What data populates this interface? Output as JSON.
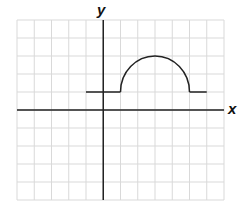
{
  "chart_data": {
    "type": "line",
    "title": "",
    "xlabel": "x",
    "ylabel": "y",
    "xlim": [
      -5,
      7
    ],
    "ylim": [
      -5,
      5
    ],
    "grid": true,
    "tick_labels": false,
    "series": [
      {
        "name": "f(x)",
        "segments": [
          {
            "kind": "line",
            "from": [
              -1,
              1
            ],
            "to": [
              1,
              1
            ]
          },
          {
            "kind": "semicircle",
            "center": [
              3,
              1
            ],
            "radius": 2,
            "from": [
              1,
              1
            ],
            "to": [
              5,
              1
            ],
            "peak": [
              3,
              3
            ]
          },
          {
            "kind": "line",
            "from": [
              5,
              1
            ],
            "to": [
              6,
              1
            ]
          }
        ]
      }
    ]
  },
  "labels": {
    "x": "x",
    "y": "y"
  },
  "colors": {
    "grid": "#d9d9d9",
    "axis": "#222222",
    "curve": "#222222"
  }
}
